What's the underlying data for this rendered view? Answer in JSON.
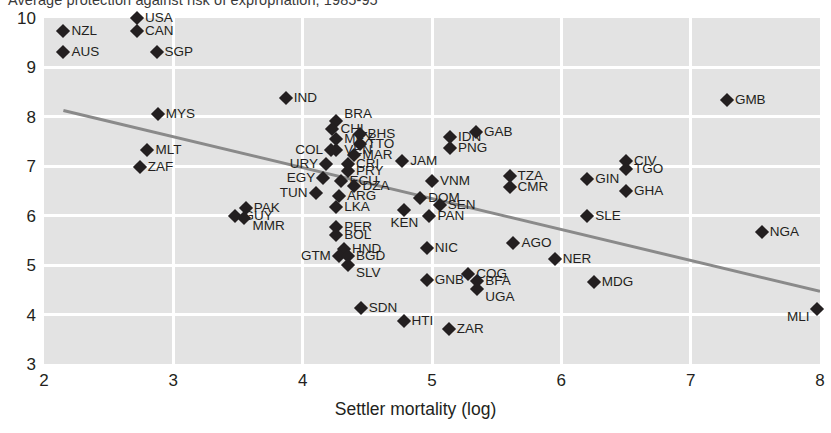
{
  "chart": {
    "title": "Average protection against risk of expropriation, 1985-95",
    "xlabel": "Settler mortality (log)",
    "ylabel": "Average protection against risk of expropriation, 1985-95"
  },
  "chart_data": {
    "type": "scatter",
    "title": "Average protection against risk of expropriation, 1985-95",
    "xlabel": "Settler mortality (log)",
    "ylabel": "Average protection against risk of expropriation, 1985-95",
    "xlim": [
      2,
      8
    ],
    "ylim": [
      3,
      10
    ],
    "xticks": [
      "2",
      "3",
      "4",
      "5",
      "6",
      "7",
      "8"
    ],
    "yticks": [
      "3",
      "4",
      "5",
      "6",
      "7",
      "8",
      "9",
      "10"
    ],
    "grid": true,
    "legend": "none",
    "marker": "diamond",
    "marker_color": "#231f20",
    "plot_bgcolor": "#e3e3e3",
    "gridline_color": "#ffffff",
    "trendline": {
      "color": "#8a8a8a",
      "x": [
        2.15,
        8.0
      ],
      "y": [
        8.13,
        4.47
      ]
    },
    "points": [
      {
        "label": "NZL",
        "x": 2.15,
        "y": 9.73,
        "pos": "right"
      },
      {
        "label": "AUS",
        "x": 2.15,
        "y": 9.32,
        "pos": "right"
      },
      {
        "label": "USA",
        "x": 2.72,
        "y": 10.0,
        "pos": "right"
      },
      {
        "label": "CAN",
        "x": 2.72,
        "y": 9.73,
        "pos": "right"
      },
      {
        "label": "SGP",
        "x": 2.87,
        "y": 9.32,
        "pos": "right"
      },
      {
        "label": "MYS",
        "x": 2.88,
        "y": 8.05,
        "pos": "right"
      },
      {
        "label": "MLT",
        "x": 2.8,
        "y": 7.32,
        "pos": "right"
      },
      {
        "label": "ZAF",
        "x": 2.74,
        "y": 6.98,
        "pos": "right"
      },
      {
        "label": "IND",
        "x": 3.87,
        "y": 8.38,
        "pos": "right"
      },
      {
        "label": "BRA",
        "x": 4.26,
        "y": 7.92,
        "pos": "above"
      },
      {
        "label": "CHL",
        "x": 4.23,
        "y": 7.75,
        "pos": "right"
      },
      {
        "label": "BHS",
        "x": 4.44,
        "y": 7.65,
        "pos": "right"
      },
      {
        "label": "MEX",
        "x": 4.26,
        "y": 7.55,
        "pos": "right"
      },
      {
        "label": "TTO",
        "x": 4.44,
        "y": 7.45,
        "pos": "right"
      },
      {
        "label": "VEN",
        "x": 4.26,
        "y": 7.32,
        "pos": "right"
      },
      {
        "label": "COL",
        "x": 4.22,
        "y": 7.32,
        "pos": "left"
      },
      {
        "label": "MAR",
        "x": 4.4,
        "y": 7.23,
        "pos": "right"
      },
      {
        "label": "CRI",
        "x": 4.35,
        "y": 7.05,
        "pos": "right"
      },
      {
        "label": "URY",
        "x": 4.18,
        "y": 7.05,
        "pos": "left"
      },
      {
        "label": "PRY",
        "x": 4.35,
        "y": 6.9,
        "pos": "right"
      },
      {
        "label": "JAM",
        "x": 4.77,
        "y": 7.1,
        "pos": "right"
      },
      {
        "label": "EGY",
        "x": 4.16,
        "y": 6.77,
        "pos": "left"
      },
      {
        "label": "ECU",
        "x": 4.3,
        "y": 6.7,
        "pos": "right"
      },
      {
        "label": "DZA",
        "x": 4.4,
        "y": 6.6,
        "pos": "right"
      },
      {
        "label": "TUN",
        "x": 4.1,
        "y": 6.45,
        "pos": "left"
      },
      {
        "label": "ARG",
        "x": 4.28,
        "y": 6.39,
        "pos": "right"
      },
      {
        "label": "LKA",
        "x": 4.26,
        "y": 6.18,
        "pos": "right"
      },
      {
        "label": "IDN",
        "x": 5.14,
        "y": 7.59,
        "pos": "right"
      },
      {
        "label": "PNG",
        "x": 5.14,
        "y": 7.37,
        "pos": "right"
      },
      {
        "label": "GAB",
        "x": 5.34,
        "y": 7.7,
        "pos": "right"
      },
      {
        "label": "VNM",
        "x": 5.0,
        "y": 6.7,
        "pos": "right"
      },
      {
        "label": "DOM",
        "x": 4.91,
        "y": 6.35,
        "pos": "right"
      },
      {
        "label": "SEN",
        "x": 5.06,
        "y": 6.21,
        "pos": "right"
      },
      {
        "label": "PAN",
        "x": 4.98,
        "y": 6.0,
        "pos": "right"
      },
      {
        "label": "KEN",
        "x": 4.78,
        "y": 6.12,
        "pos": "ctr_b"
      },
      {
        "label": "TZA",
        "x": 5.6,
        "y": 6.8,
        "pos": "right"
      },
      {
        "label": "CMR",
        "x": 5.6,
        "y": 6.58,
        "pos": "right"
      },
      {
        "label": "GIN",
        "x": 6.2,
        "y": 6.75,
        "pos": "right"
      },
      {
        "label": "CIV",
        "x": 6.5,
        "y": 7.1,
        "pos": "right"
      },
      {
        "label": "TGO",
        "x": 6.5,
        "y": 6.95,
        "pos": "right"
      },
      {
        "label": "GHA",
        "x": 6.5,
        "y": 6.5,
        "pos": "right"
      },
      {
        "label": "GMB",
        "x": 7.28,
        "y": 8.35,
        "pos": "right"
      },
      {
        "label": "SLE",
        "x": 6.2,
        "y": 6.0,
        "pos": "right"
      },
      {
        "label": "NGA",
        "x": 7.55,
        "y": 5.68,
        "pos": "right"
      },
      {
        "label": "PAK",
        "x": 3.56,
        "y": 6.15,
        "pos": "right"
      },
      {
        "label": "GUY",
        "x": 3.48,
        "y": 6.0,
        "pos": "right"
      },
      {
        "label": "MMR",
        "x": 3.55,
        "y": 5.95,
        "pos": "below"
      },
      {
        "label": "PER",
        "x": 4.26,
        "y": 5.78,
        "pos": "right"
      },
      {
        "label": "BOL",
        "x": 4.26,
        "y": 5.6,
        "pos": "right"
      },
      {
        "label": "HND",
        "x": 4.32,
        "y": 5.32,
        "pos": "right"
      },
      {
        "label": "GTM",
        "x": 4.28,
        "y": 5.18,
        "pos": "left"
      },
      {
        "label": "BGD",
        "x": 4.35,
        "y": 5.18,
        "pos": "right"
      },
      {
        "label": "SLV",
        "x": 4.35,
        "y": 5.0,
        "pos": "below"
      },
      {
        "label": "NIC",
        "x": 4.96,
        "y": 5.35,
        "pos": "right"
      },
      {
        "label": "AGO",
        "x": 5.63,
        "y": 5.45,
        "pos": "right"
      },
      {
        "label": "NER",
        "x": 5.95,
        "y": 5.12,
        "pos": "right"
      },
      {
        "label": "MDG",
        "x": 6.25,
        "y": 4.65,
        "pos": "right"
      },
      {
        "label": "GNB",
        "x": 4.96,
        "y": 4.7,
        "pos": "right"
      },
      {
        "label": "COG",
        "x": 5.28,
        "y": 4.82,
        "pos": "right"
      },
      {
        "label": "BFA",
        "x": 5.35,
        "y": 4.67,
        "pos": "right"
      },
      {
        "label": "UGA",
        "x": 5.35,
        "y": 4.52,
        "pos": "below"
      },
      {
        "label": "SDN",
        "x": 4.45,
        "y": 4.13,
        "pos": "right"
      },
      {
        "label": "HTI",
        "x": 4.78,
        "y": 3.87,
        "pos": "right"
      },
      {
        "label": "ZAR",
        "x": 5.13,
        "y": 3.7,
        "pos": "right"
      },
      {
        "label": "MLI",
        "x": 7.98,
        "y": 4.12,
        "pos": "bl"
      }
    ]
  }
}
